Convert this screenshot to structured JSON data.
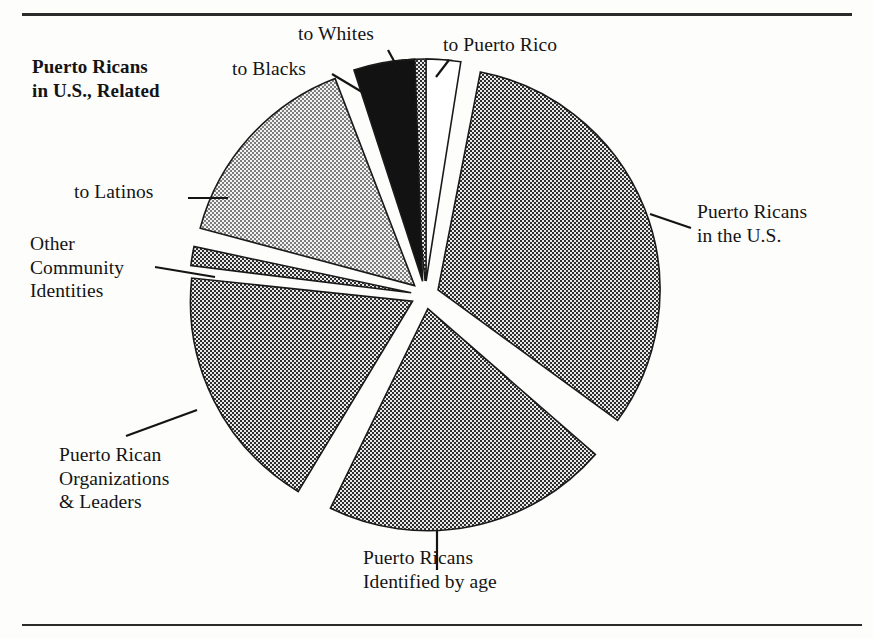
{
  "figure": {
    "title": "Puerto Ricans\nin U.S., Related",
    "background": "#fdfdfb",
    "rule_color": "#2b2b2b"
  },
  "labels": {
    "to_blacks": "to Blacks",
    "to_whites": "to Whites",
    "to_puerto_rico": "to Puerto Rico",
    "puerto_ricans_in_us": "Puerto Ricans\nin the U.S.",
    "to_latinos": "to Latinos",
    "other_community_identities": "Other\nCommunity\nIdentities",
    "pr_organizations": "Puerto Rican\nOrganizations\n& Leaders",
    "pr_identified_by_age": "Puerto Ricans\nIdentified by age"
  },
  "chart_data": {
    "type": "pie",
    "title": "Puerto Ricans in U.S., Related",
    "xlabel": "",
    "ylabel": "",
    "legend_position": "none",
    "grid": false,
    "exploded": true,
    "center": {
      "x": 425,
      "y": 295
    },
    "radius": 222,
    "explode_offset": 14,
    "slices": [
      {
        "label": "to Puerto Rico",
        "value": 6,
        "start_angle": -96,
        "end_angle": -83,
        "fill": "#8a8a8a",
        "pattern": "checker-50",
        "stroke": "#1a1a1a"
      },
      {
        "label": "Puerto Ricans in the U.S.",
        "value": 32,
        "start_angle": -79,
        "end_angle": 36,
        "fill": "#8a8a8a",
        "pattern": "checker-50",
        "stroke": "#1a1a1a"
      },
      {
        "label": "Puerto Ricans Identified by age",
        "value": 23,
        "start_angle": 41,
        "end_angle": 116,
        "fill": "#8a8a8a",
        "pattern": "checker-50",
        "stroke": "#1a1a1a"
      },
      {
        "label": "Puerto Rican Organizations & Leaders",
        "value": 20,
        "start_angle": 121,
        "end_angle": 186,
        "fill": "#8a8a8a",
        "pattern": "checker-50",
        "stroke": "#1a1a1a"
      },
      {
        "label": "Other Community Identities",
        "value": 2,
        "start_angle": 187,
        "end_angle": 192,
        "fill": "#8a8a8a",
        "pattern": "checker-50",
        "stroke": "#1a1a1a"
      },
      {
        "label": "to Latinos",
        "value": 16,
        "start_angle": 195,
        "end_angle": 249,
        "fill": "#bfbfbf",
        "pattern": "checker-25",
        "stroke": "#1a1a1a"
      },
      {
        "label": "to Blacks",
        "value": 5,
        "start_angle": 252,
        "end_angle": 268,
        "fill": "#121212",
        "pattern": "solid-black",
        "stroke": "#1a1a1a"
      },
      {
        "label": "to Whites",
        "value": 3,
        "start_angle": 270,
        "end_angle": 279,
        "fill": "#ffffff",
        "pattern": "none",
        "stroke": "#1a1a1a"
      }
    ],
    "leader_lines": [
      {
        "label": "to Blacks",
        "from": [
          332,
          74
        ],
        "to": [
          362,
          92
        ]
      },
      {
        "label": "to Whites",
        "from": [
          388,
          50
        ],
        "to": [
          400,
          72
        ]
      },
      {
        "label": "to Puerto Rico",
        "from": [
          449,
          60
        ],
        "to": [
          436,
          77
        ]
      },
      {
        "label": "Puerto Ricans in the U.S.",
        "from": [
          691,
          228
        ],
        "to": [
          650,
          214
        ]
      },
      {
        "label": "to Latinos",
        "from": [
          188,
          198
        ],
        "to": [
          228,
          198
        ]
      },
      {
        "label": "Other Community Identities",
        "from": [
          155,
          267
        ],
        "to": [
          215,
          277
        ]
      },
      {
        "label": "Puerto Rican Organizations & Leaders",
        "from": [
          126,
          436
        ],
        "to": [
          197,
          410
        ]
      },
      {
        "label": "Puerto Ricans Identified by age",
        "from": [
          437,
          531
        ],
        "to": [
          437,
          570
        ]
      }
    ]
  }
}
